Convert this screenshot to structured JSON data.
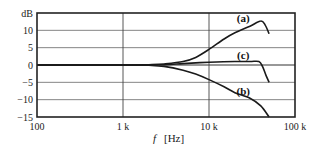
{
  "chart_data": {
    "type": "line",
    "title": "",
    "xlabel_symbol": "f",
    "xlabel_unit": "[Hz]",
    "ylabel": "dB",
    "xscale": "log",
    "xlim": [
      100,
      100000
    ],
    "ylim": [
      -15,
      15
    ],
    "grid": true,
    "x_ticks": [
      {
        "value": 100,
        "label": "100"
      },
      {
        "value": 1000,
        "label": "1 k"
      },
      {
        "value": 10000,
        "label": "10 k"
      },
      {
        "value": 100000,
        "label": "100 k"
      }
    ],
    "y_ticks": [
      {
        "value": 15,
        "label": "dB"
      },
      {
        "value": 10,
        "label": "10"
      },
      {
        "value": 5,
        "label": "5"
      },
      {
        "value": 0,
        "label": "0"
      },
      {
        "value": -5,
        "label": "-5"
      },
      {
        "value": -10,
        "label": "-10"
      },
      {
        "value": -15,
        "label": "-15"
      }
    ],
    "series": [
      {
        "name": "(a)",
        "x": [
          100,
          1000,
          2000,
          3000,
          5000,
          7000,
          10000,
          15000,
          20000,
          30000,
          40000,
          45000,
          50000
        ],
        "y": [
          0,
          0,
          0.1,
          0.3,
          1.0,
          2.2,
          4.5,
          7.5,
          9.3,
          11.2,
          12.7,
          11.5,
          9.0
        ]
      },
      {
        "name": "(c)",
        "x": [
          100,
          1000,
          3000,
          5000,
          10000,
          20000,
          30000,
          38000,
          42000,
          46000,
          50000
        ],
        "y": [
          0,
          0,
          0.1,
          0.4,
          0.8,
          1.0,
          1.0,
          1.0,
          -0.5,
          -3.0,
          -5.0
        ]
      },
      {
        "name": "(b)",
        "x": [
          100,
          1000,
          2000,
          3000,
          5000,
          7000,
          10000,
          15000,
          20000,
          30000,
          40000,
          50000
        ],
        "y": [
          0,
          0,
          -0.1,
          -0.4,
          -1.5,
          -2.6,
          -4.2,
          -6.3,
          -8.0,
          -9.6,
          -11.8,
          -15.0
        ]
      }
    ],
    "annotations": [
      {
        "text": "(a)",
        "x": 25000,
        "y": 13.5
      },
      {
        "text": "(c)",
        "x": 25000,
        "y": 3.0
      },
      {
        "text": "(b)",
        "x": 25000,
        "y": -7.5
      }
    ]
  }
}
